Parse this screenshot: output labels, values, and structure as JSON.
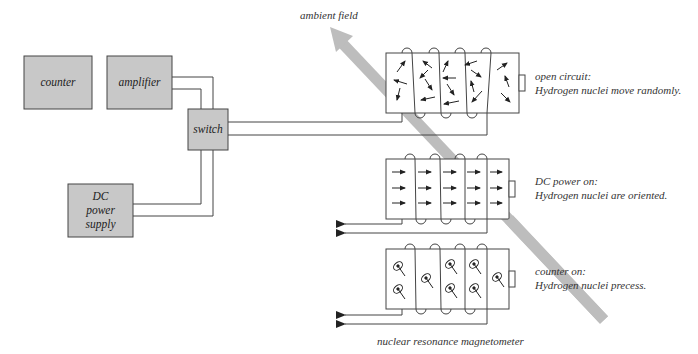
{
  "title": "nuclear resonance magnetometer",
  "ambient_field_label": "ambient field",
  "colors": {
    "box_fill": "#c8c8c8",
    "line": "#444444",
    "field_band": "#bdbdbd",
    "text": "#333333"
  },
  "components": {
    "counter": "counter",
    "amplifier": "amplifier",
    "switch": "switch",
    "dc_power_supply": [
      "DC",
      "power",
      "supply"
    ]
  },
  "states": [
    {
      "heading": "open circuit:",
      "description": "Hydrogen nuclei move randomly.",
      "nuclei": "random"
    },
    {
      "heading": "DC power on:",
      "description": "Hydrogen nuclei are oriented.",
      "nuclei": "oriented"
    },
    {
      "heading": "counter on:",
      "description": "Hydrogen nuclei precess.",
      "nuclei": "precessing"
    }
  ]
}
